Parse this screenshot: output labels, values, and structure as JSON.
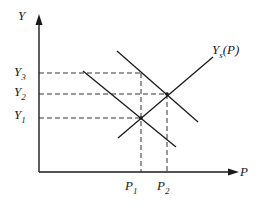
{
  "diagram": {
    "title": "",
    "axes": {
      "y_label": "Y",
      "x_label": "P"
    },
    "y_ticks": [
      {
        "main": "Y",
        "sub": "3"
      },
      {
        "main": "Y",
        "sub": "2"
      },
      {
        "main": "Y",
        "sub": "1"
      }
    ],
    "x_ticks": [
      {
        "main": "P",
        "sub": "1"
      },
      {
        "main": "P",
        "sub": "2"
      }
    ],
    "supply_curve_label": {
      "main": "Y",
      "sub": "s",
      "suffix": "(P)"
    },
    "curves": [
      {
        "name": "supply",
        "description": "upward-sloping Ys(P)"
      },
      {
        "name": "demand-1",
        "description": "lower downward-sloping curve"
      },
      {
        "name": "demand-2",
        "description": "upper downward-sloping curve"
      }
    ],
    "colors": {
      "line": "#1a1a1a",
      "background": "#ffffff"
    }
  }
}
